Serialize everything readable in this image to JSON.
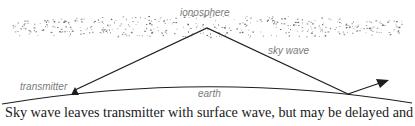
{
  "diagram": {
    "labels": {
      "ionosphere": "ionosphere",
      "sky_wave": "sky wave",
      "transmitter": "transmitter",
      "earth": "earth"
    },
    "colors": {
      "line": "#1e1e1e",
      "label": "#7a7a7a",
      "dots": "#555555"
    },
    "elements": {
      "ionosphere_band": "stippled-dots",
      "transmitter_icon": "triangle",
      "reflected_arrow": "arrow"
    }
  },
  "caption": "Sky wave leaves transmitter with surface wave, but may be delayed and"
}
